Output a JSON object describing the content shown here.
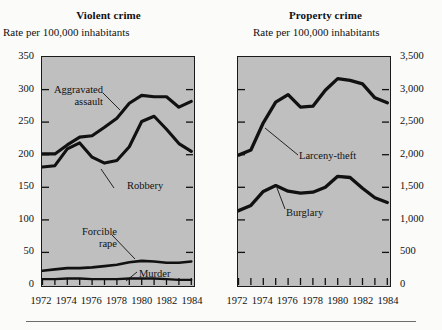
{
  "figure": {
    "bottom_rule": true,
    "background": "#fbfbfa",
    "plot_fill": "#bfbfbf",
    "line_color": "#111111"
  },
  "panels": {
    "left": {
      "title": "Violent crime",
      "axis_caption": "Rate per 100,000 inhabitants",
      "y_ticks": [
        "0",
        "50",
        "100",
        "150",
        "200",
        "250",
        "300",
        "350"
      ],
      "x_ticks": [
        "1972",
        "1974",
        "1976",
        "1978",
        "1980",
        "1982",
        "1984"
      ],
      "labels": {
        "aggravated_assault_l1": "Aggravated",
        "aggravated_assault_l2": "assault",
        "robbery": "Robbery",
        "forcible_rape_l1": "Forcible",
        "forcible_rape_l2": "rape",
        "murder": "Murder"
      }
    },
    "right": {
      "title": "Property crime",
      "axis_caption": "Rate per 100,000 inhabitants",
      "y_ticks": [
        "0",
        "500",
        "1,000",
        "1,500",
        "2,000",
        "2,500",
        "3,000",
        "3,500"
      ],
      "x_ticks": [
        "1972",
        "1974",
        "1976",
        "1978",
        "1980",
        "1982",
        "1984"
      ],
      "labels": {
        "larceny_theft": "Larceny-theft",
        "burglary": "Burglary"
      }
    }
  },
  "chart_data": [
    {
      "type": "line",
      "title": "Violent crime",
      "subtitle": "Rate per 100,000 inhabitants",
      "xlabel": "",
      "ylabel": "Rate per 100,000 inhabitants",
      "xlim": [
        1972,
        1984
      ],
      "ylim": [
        0,
        350
      ],
      "ytick_step": 50,
      "grid": false,
      "legend": "inline-annotations",
      "x": [
        1972,
        1973,
        1974,
        1975,
        1976,
        1977,
        1978,
        1979,
        1980,
        1981,
        1982,
        1983,
        1984
      ],
      "series": [
        {
          "name": "Aggravated assault",
          "values": [
            201,
            201,
            215,
            227,
            229,
            242,
            256,
            279,
            291,
            289,
            289,
            273,
            282
          ]
        },
        {
          "name": "Robbery",
          "values": [
            181,
            183,
            209,
            218,
            196,
            187,
            191,
            212,
            251,
            259,
            239,
            217,
            205
          ]
        },
        {
          "name": "Forcible rape",
          "values": [
            22,
            24,
            26,
            26,
            27,
            29,
            31,
            35,
            37,
            36,
            34,
            34,
            36
          ]
        },
        {
          "name": "Murder",
          "values": [
            9,
            9,
            10,
            10,
            9,
            9,
            9,
            10,
            10,
            10,
            9,
            8,
            8
          ]
        }
      ]
    },
    {
      "type": "line",
      "title": "Property crime",
      "subtitle": "Rate per 100,000 inhabitants",
      "xlabel": "",
      "ylabel": "Rate per 100,000 inhabitants",
      "xlim": [
        1972,
        1984
      ],
      "ylim": [
        0,
        3500
      ],
      "ytick_step": 500,
      "grid": false,
      "legend": "inline-annotations",
      "x": [
        1972,
        1973,
        1974,
        1975,
        1976,
        1977,
        1978,
        1979,
        1980,
        1981,
        1982,
        1983,
        1984
      ],
      "series": [
        {
          "name": "Larceny-theft",
          "values": [
            1994,
            2072,
            2490,
            2805,
            2921,
            2730,
            2744,
            2989,
            3167,
            3140,
            3085,
            2871,
            2795
          ]
        },
        {
          "name": "Burglary",
          "values": [
            1141,
            1223,
            1437,
            1525,
            1439,
            1410,
            1424,
            1499,
            1668,
            1650,
            1484,
            1338,
            1264
          ]
        }
      ]
    }
  ]
}
